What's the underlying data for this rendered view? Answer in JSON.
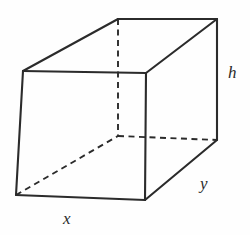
{
  "figure": {
    "kind": "rectangular-box-diagram",
    "canvas": {
      "width": 250,
      "height": 235
    },
    "background_color": "#fefefe",
    "stroke_color": "#2b2b2b",
    "solid_stroke_width": 2.1,
    "dashed_stroke_width": 1.9,
    "dash_pattern": "6,4.5",
    "labels": [
      {
        "id": "h",
        "text": "h",
        "meaning": "height",
        "x": 228,
        "y": 64
      },
      {
        "id": "y",
        "text": "y",
        "meaning": "depth",
        "x": 200,
        "y": 175
      },
      {
        "id": "x",
        "text": "x",
        "meaning": "width",
        "x": 63,
        "y": 210
      }
    ],
    "vertices": {
      "front_top_left": {
        "x": 23,
        "y": 71
      },
      "front_top_right": {
        "x": 146,
        "y": 73
      },
      "front_bottom_right": {
        "x": 145,
        "y": 200
      },
      "front_bottom_left": {
        "x": 16,
        "y": 195
      },
      "back_top_left": {
        "x": 118,
        "y": 19
      },
      "back_top_right": {
        "x": 217,
        "y": 19
      },
      "back_bottom_right": {
        "x": 217,
        "y": 140
      },
      "back_bottom_left_hidden": {
        "x": 118,
        "y": 136
      }
    },
    "solid_edges": [
      {
        "name": "front-top-edge",
        "from": "front_top_left",
        "to": "front_top_right"
      },
      {
        "name": "front-right-edge",
        "from": "front_top_right",
        "to": "front_bottom_right"
      },
      {
        "name": "front-bottom-edge",
        "from": "front_bottom_right",
        "to": "front_bottom_left"
      },
      {
        "name": "front-left-edge",
        "from": "front_bottom_left",
        "to": "front_top_left"
      },
      {
        "name": "top-left-receding-edge",
        "from": "front_top_left",
        "to": "back_top_left"
      },
      {
        "name": "back-top-edge",
        "from": "back_top_left",
        "to": "back_top_right"
      },
      {
        "name": "top-right-receding-edge",
        "from": "front_top_right",
        "to": "back_top_right"
      },
      {
        "name": "back-right-vertical-edge",
        "from": "back_top_right",
        "to": "back_bottom_right"
      },
      {
        "name": "bottom-right-receding-edge",
        "from": "front_bottom_right",
        "to": "back_bottom_right"
      }
    ],
    "dashed_edges": [
      {
        "name": "hidden-back-left-vertical-edge",
        "from": "back_top_left",
        "to": "back_bottom_left_hidden"
      },
      {
        "name": "hidden-back-bottom-edge",
        "from": "back_bottom_left_hidden",
        "to": "back_bottom_right"
      },
      {
        "name": "hidden-bottom-left-receding-edge",
        "from": "front_bottom_left",
        "to": "back_bottom_left_hidden"
      }
    ]
  }
}
